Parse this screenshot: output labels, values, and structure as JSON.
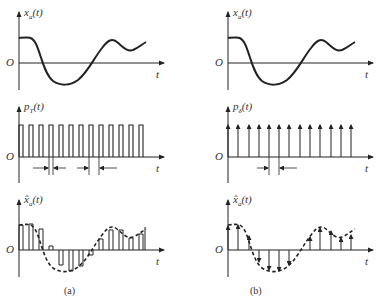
{
  "panels": [
    {
      "id": "a",
      "caption": "(a)",
      "rows": [
        {
          "label": "x_a(t)",
          "label_main": "x",
          "label_sub": "a",
          "label_tail": "(t)",
          "origin": "O",
          "axis": "t",
          "type": "continuous-signal"
        },
        {
          "label": "p_T(t)",
          "label_main": "p",
          "label_sub": "T",
          "label_tail": "(t)",
          "origin": "O",
          "axis": "t",
          "type": "rectangular-pulse-train"
        },
        {
          "label": "x̂_a(t)",
          "label_main": "x̂",
          "label_sub": "a",
          "label_tail": "(t)",
          "origin": "O",
          "axis": "t",
          "type": "pulse-amplitude-sampled-signal"
        }
      ]
    },
    {
      "id": "b",
      "caption": "(b)",
      "rows": [
        {
          "label": "x_a(t)",
          "label_main": "x",
          "label_sub": "a",
          "label_tail": "(t)",
          "origin": "O",
          "axis": "t",
          "type": "continuous-signal"
        },
        {
          "label": "p_δ(t)",
          "label_main": "p",
          "label_sub": "δ",
          "label_tail": "(t)",
          "origin": "O",
          "axis": "t",
          "type": "impulse-train"
        },
        {
          "label": "x̂_a(t)",
          "label_main": "x̂",
          "label_sub": "a",
          "label_tail": "(t)",
          "origin": "O",
          "axis": "t",
          "type": "ideal-sampled-signal"
        }
      ]
    }
  ],
  "colors": {
    "ink": "#222222",
    "background": "#ffffff"
  }
}
